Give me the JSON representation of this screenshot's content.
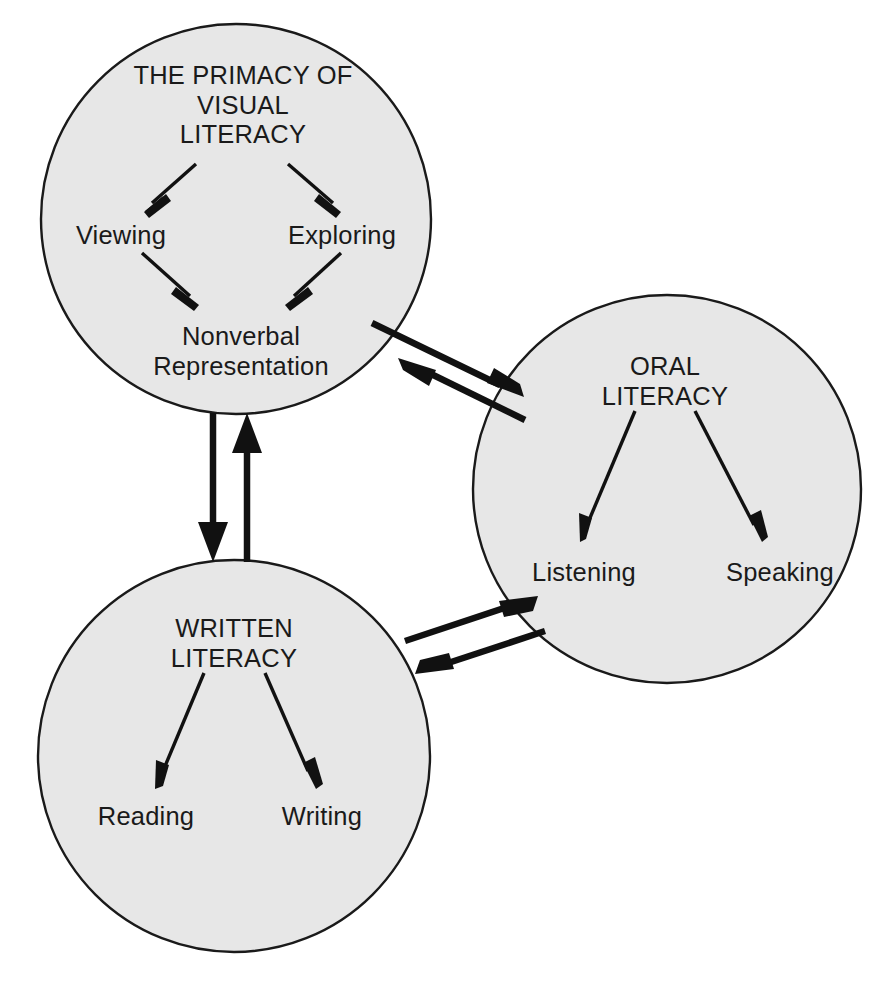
{
  "diagram": {
    "title": "The Primacy of Visual Literacy",
    "background_color": "#ffffff",
    "circle_fill_color": "#e7e7e7",
    "circle_stroke_color": "#1a1a1a",
    "arrow_color": "#111111",
    "nodes": [
      {
        "id": "visual-literacy",
        "heading": "THE PRIMACY OF\nVISUAL\nLITERACY",
        "children": [
          {
            "id": "viewing",
            "label": "Viewing"
          },
          {
            "id": "exploring",
            "label": "Exploring"
          },
          {
            "id": "nonverbal-representation",
            "label": "Nonverbal\nRepresentation"
          }
        ]
      },
      {
        "id": "oral-literacy",
        "heading": "ORAL\nLITERACY",
        "children": [
          {
            "id": "listening",
            "label": "Listening"
          },
          {
            "id": "speaking",
            "label": "Speaking"
          }
        ]
      },
      {
        "id": "written-literacy",
        "heading": "WRITTEN\nLITERACY",
        "children": [
          {
            "id": "reading",
            "label": "Reading"
          },
          {
            "id": "writing",
            "label": "Writing"
          }
        ]
      }
    ],
    "connections": [
      {
        "id": "visual-oral",
        "from": "visual-literacy",
        "to": "oral-literacy",
        "style": "bidirectional-double-arrow"
      },
      {
        "id": "visual-written",
        "from": "visual-literacy",
        "to": "written-literacy",
        "style": "bidirectional-double-arrow"
      },
      {
        "id": "written-oral",
        "from": "written-literacy",
        "to": "oral-literacy",
        "style": "bidirectional-double-arrow"
      }
    ]
  }
}
